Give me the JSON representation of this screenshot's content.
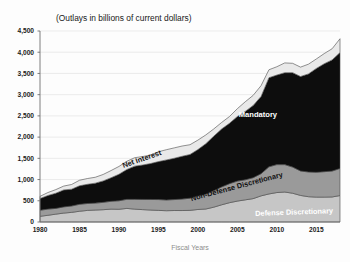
{
  "chart_data": {
    "type": "area",
    "stacked": true,
    "title": "(Outlays in billions of current dollars)",
    "xlabel": "Fiscal Years",
    "ylabel": "",
    "xlim": [
      1980,
      2018
    ],
    "ylim": [
      0,
      4500
    ],
    "grid": true,
    "legend_position": "inline-labels",
    "x": [
      1980,
      1981,
      1982,
      1983,
      1984,
      1985,
      1986,
      1987,
      1988,
      1989,
      1990,
      1991,
      1992,
      1993,
      1994,
      1995,
      1996,
      1997,
      1998,
      1999,
      2000,
      2001,
      2002,
      2003,
      2004,
      2005,
      2006,
      2007,
      2008,
      2009,
      2010,
      2011,
      2012,
      2013,
      2014,
      2015,
      2016,
      2017,
      2018
    ],
    "xticks": [
      1980,
      1985,
      1990,
      1995,
      2000,
      2005,
      2010,
      2015
    ],
    "xtick_labels": [
      "1980",
      "1985",
      "1990",
      "1995",
      "2000",
      "2005",
      "2010",
      "2015"
    ],
    "yticks": [
      0,
      500,
      1000,
      1500,
      2000,
      2500,
      3000,
      3500,
      4000,
      4500
    ],
    "ytick_labels": [
      "0",
      "500",
      "1,000",
      "1,500",
      "2,000",
      "2,500",
      "3,000",
      "3,500",
      "4,000",
      "4,500"
    ],
    "series": [
      {
        "name": "Defense Discretionary",
        "color": "#c6c6c6",
        "label_color": "#ffffff",
        "label_x": 2012.2,
        "label_y": 175,
        "label_rotate": -2,
        "values": [
          134,
          158,
          185,
          210,
          227,
          253,
          273,
          282,
          290,
          304,
          300,
          320,
          303,
          292,
          282,
          274,
          266,
          271,
          270,
          275,
          295,
          306,
          349,
          405,
          455,
          493,
          522,
          551,
          616,
          661,
          694,
          706,
          678,
          626,
          596,
          586,
          586,
          590,
          623
        ]
      },
      {
        "name": "Non-Defense Discretionary",
        "color": "#9a9a9a",
        "label_color": "#111111",
        "label_x": 2005.0,
        "label_y": 780,
        "label_rotate": -15,
        "values": [
          142,
          146,
          136,
          146,
          150,
          163,
          163,
          163,
          173,
          184,
          200,
          214,
          231,
          240,
          249,
          255,
          253,
          258,
          271,
          286,
          320,
          345,
          385,
          421,
          448,
          471,
          472,
          493,
          522,
          639,
          658,
          646,
          615,
          576,
          583,
          585,
          600,
          610,
          639
        ]
      },
      {
        "name": "Mandatory",
        "color": "#0d0d0d",
        "label_color": "#ffffff",
        "label_x": 2007.6,
        "label_y": 2480,
        "label_rotate": 0,
        "values": [
          276,
          321,
          357,
          400,
          396,
          437,
          452,
          470,
          505,
          555,
          625,
          703,
          782,
          811,
          846,
          894,
          943,
          973,
          1008,
          1030,
          1091,
          1194,
          1286,
          1365,
          1422,
          1522,
          1612,
          1702,
          1821,
          2100,
          2110,
          2166,
          2226,
          2226,
          2310,
          2447,
          2542,
          2619,
          2731
        ]
      },
      {
        "name": "Net Interest",
        "color": "#e9e9e9",
        "label_color": "#111111",
        "label_x": 1993.0,
        "label_y": 1430,
        "label_rotate": -19,
        "values": [
          53,
          69,
          85,
          90,
          111,
          130,
          136,
          139,
          152,
          169,
          184,
          194,
          199,
          199,
          203,
          232,
          241,
          244,
          241,
          230,
          223,
          206,
          171,
          153,
          160,
          184,
          227,
          238,
          253,
          187,
          196,
          230,
          220,
          221,
          229,
          223,
          240,
          263,
          325
        ]
      }
    ],
    "annotations": [
      {
        "text": "Mandatory",
        "on": "black-band"
      },
      {
        "text": "Net Interest",
        "on": "light-band"
      },
      {
        "text": "Non-Defense Discretionary",
        "on": "mid-gray-band"
      },
      {
        "text": "Defense Discretionary",
        "on": "light-gray-band"
      }
    ]
  }
}
